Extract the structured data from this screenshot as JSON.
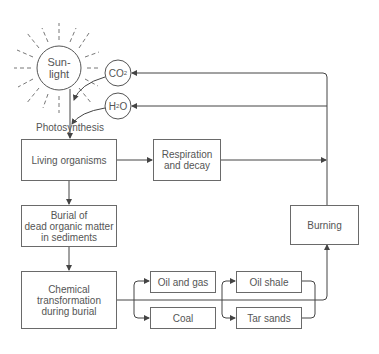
{
  "diagram": {
    "sun": {
      "label": "Sun-\nlight"
    },
    "co2": {
      "label_main": "CO",
      "label_sub": "2"
    },
    "h2o": {
      "label_main": "H",
      "label_sub": "2",
      "label_end": "O"
    },
    "photosynthesis_label": "Photosynthesis",
    "nodes": {
      "living_organisms": "Living organisms",
      "respiration": "Respiration\nand decay",
      "burial": "Burial of\ndead organic matter\nin sediments",
      "chemical": "Chemical\ntransformation\nduring burial",
      "oil_gas": "Oil and gas",
      "coal": "Coal",
      "oil_shale": "Oil shale",
      "tar_sands": "Tar sands",
      "burning": "Burning"
    },
    "colors": {
      "line": "#555555",
      "text": "#555555"
    }
  }
}
